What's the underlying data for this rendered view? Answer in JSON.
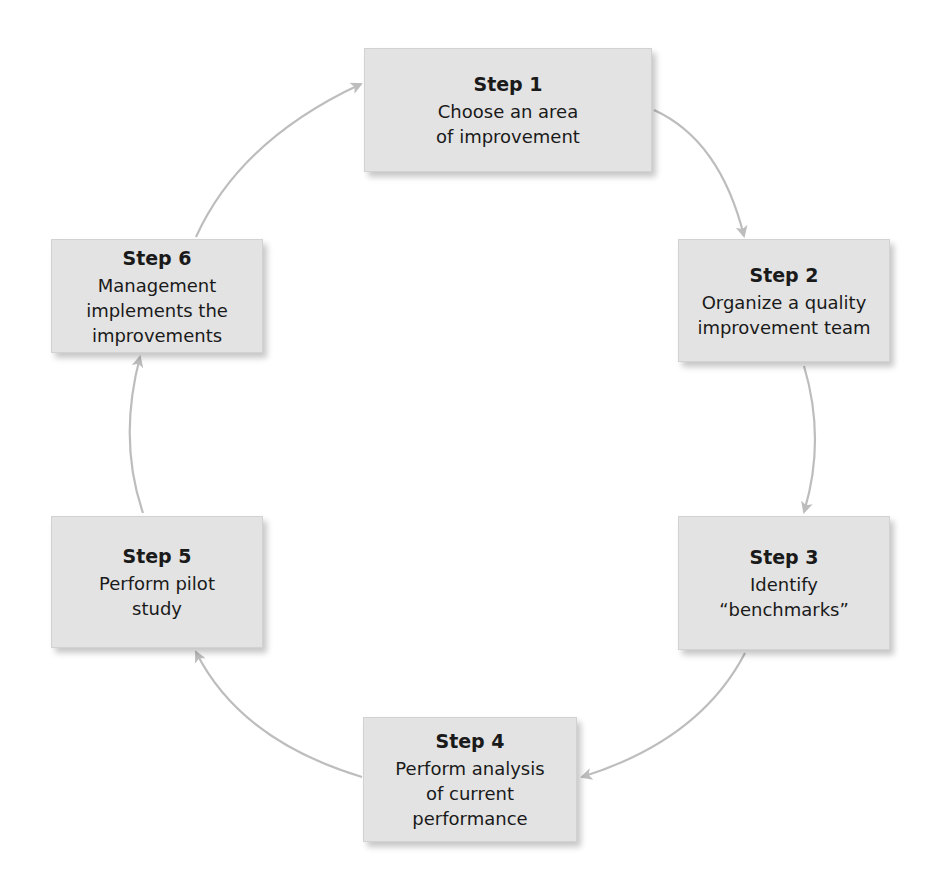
{
  "diagram": {
    "type": "cycle",
    "colors": {
      "box_fill": "#e3e3e3",
      "arrow": "#bdbdbd",
      "text": "#1a1a1a"
    },
    "steps": [
      {
        "title": "Step 1",
        "desc": "Choose an area\nof improvement"
      },
      {
        "title": "Step 2",
        "desc": "Organize a quality\nimprovement team"
      },
      {
        "title": "Step 3",
        "desc": "Identify\n“benchmarks”"
      },
      {
        "title": "Step 4",
        "desc": "Perform analysis\nof current\nperformance"
      },
      {
        "title": "Step 5",
        "desc": "Perform pilot\nstudy"
      },
      {
        "title": "Step 6",
        "desc": "Management\nimplements the\nimprovements"
      }
    ],
    "flow": [
      "Step 1 -> Step 2",
      "Step 2 -> Step 3",
      "Step 3 -> Step 4",
      "Step 4 -> Step 5",
      "Step 5 -> Step 6",
      "Step 6 -> Step 1"
    ]
  }
}
